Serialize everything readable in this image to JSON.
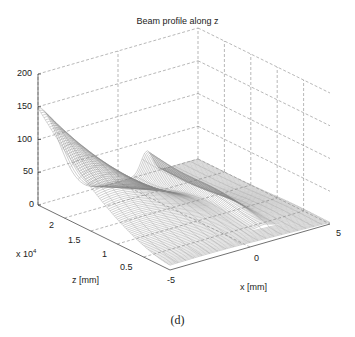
{
  "chart_data": {
    "type": "surface3d",
    "title": "Beam profile along z",
    "xlabel": "x [mm]",
    "ylabel": "z [mm]",
    "ylabel_multiplier": "x 10^4",
    "zlabel": "",
    "xlim": [
      -5,
      5
    ],
    "ylim": [
      0,
      25000
    ],
    "zlim": [
      0,
      200
    ],
    "x_ticks": [
      -5,
      0,
      5
    ],
    "y_ticks": [
      0.5,
      1,
      1.5,
      2
    ],
    "y_tick_labels": [
      "0.5",
      "1",
      "1.5",
      "2"
    ],
    "z_ticks": [
      0,
      50,
      100,
      150,
      200
    ],
    "grid": true,
    "grid_style": "dashed",
    "surface_style": "mesh",
    "peak_value_approx": 140,
    "peak_location": {
      "x": -5,
      "z_mm": 25000
    }
  },
  "caption": "(d)",
  "labels": {
    "title": "Beam profile along z",
    "x_axis": "x [mm]",
    "z_axis": "z [mm]",
    "multiplier": "x 10",
    "multiplier_exp": "4",
    "ztick_200": "200",
    "ztick_150": "150",
    "ztick_100": "100",
    "ztick_50": "50",
    "ztick_0": "0",
    "ytick_2": "2",
    "ytick_15": "1.5",
    "ytick_1": "1",
    "ytick_05": "0.5",
    "xtick_m5": "-5",
    "xtick_0": "0",
    "xtick_5": "5"
  }
}
